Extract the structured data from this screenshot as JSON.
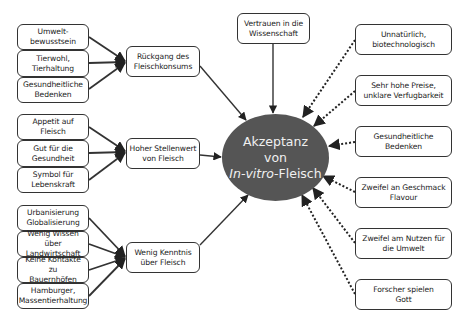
{
  "center": {
    "line1": "Akzeptanz",
    "line2": "von",
    "line3_italic": "In-vitro",
    "line3_rest": "-Fleisch",
    "fill_color": "#555555"
  },
  "top_node": {
    "label": "Vertrauen in die\nWissenschaft"
  },
  "groups": [
    {
      "hub": "Rückgang des\nFleischkonsums",
      "leaves": [
        "Umwelt-\nbewusstsein",
        "Tierwohl,\nTierhaltung",
        "Gesundheitliche\nBedenken"
      ]
    },
    {
      "hub": "Hoher Stellenwert\nvon Fleisch",
      "leaves": [
        "Appetit auf\nFleisch",
        "Gut für die\nGesundheit",
        "Symbol für\nLebenskraft"
      ]
    },
    {
      "hub": "Wenig Kenntnis\nüber  Fleisch",
      "leaves": [
        "Urbanisierung\nGlobalisierung",
        "Wenig Wissen über\nLandwirtschaft",
        "Keine Kontakte zu\nBauernhöfen",
        "Hamburger,\nMassentierhaltung"
      ]
    }
  ],
  "negative_factors": [
    "Unnatürlich,\nbiotechnologisch",
    "Sehr hohe Preise,\nunklare Verfugbarkeit",
    "Gesundheitliche\nBedenken",
    "Zweifel an Geschmack\nFlavour",
    "Zweifel am Nutzen für\ndie Umwelt",
    "Forscher spielen\nGott"
  ],
  "legend": {
    "solid_arrow": "positive influence",
    "dotted_arrow": "negative influence"
  }
}
